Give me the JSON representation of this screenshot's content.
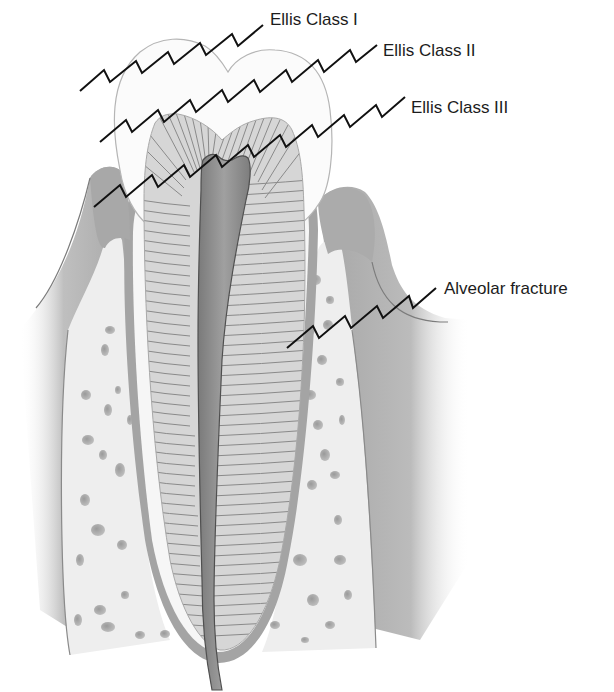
{
  "diagram": {
    "labels": [
      {
        "id": "ellis-class-1",
        "text": "Ellis Class I",
        "x": 270,
        "y": 18
      },
      {
        "id": "ellis-class-2",
        "text": "Ellis Class II",
        "x": 383,
        "y": 49
      },
      {
        "id": "ellis-class-3",
        "text": "Ellis Class III",
        "x": 411,
        "y": 106
      },
      {
        "id": "alveolar-fracture",
        "text": "Alveolar fracture",
        "x": 444,
        "y": 287
      }
    ],
    "colors": {
      "background": "#ffffff",
      "enamel": "#fbfbfb",
      "enamel_outline": "#b5b5b5",
      "dentin": "#d4d4d4",
      "dentin_lines": "#8a8a8a",
      "pulp": "#8f8f8f",
      "gum": "#a8a8a8",
      "bone": "#efefef",
      "bone_holes": "#9a9a9a",
      "fracture_line": "#111111",
      "label_text": "#1c1c1c"
    }
  }
}
